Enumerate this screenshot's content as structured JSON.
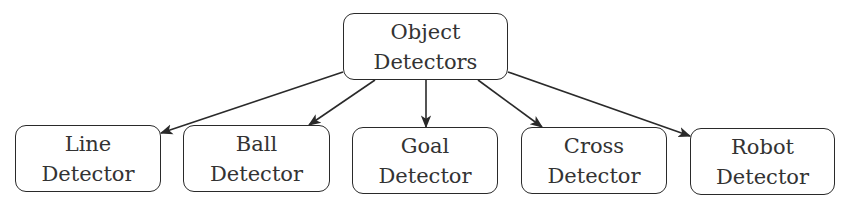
{
  "diagram": {
    "root": {
      "id": "object-detectors",
      "lines": [
        "Object",
        "Detectors"
      ],
      "box": [
        343,
        13,
        165,
        67
      ]
    },
    "children": [
      {
        "id": "line-detector",
        "lines": [
          "Line",
          "Detector"
        ],
        "box": [
          15,
          125,
          146,
          67
        ]
      },
      {
        "id": "ball-detector",
        "lines": [
          "Ball",
          "Detector"
        ],
        "box": [
          183,
          125,
          147,
          67
        ]
      },
      {
        "id": "goal-detector",
        "lines": [
          "Goal",
          "Detector"
        ],
        "box": [
          352,
          127,
          146,
          67
        ]
      },
      {
        "id": "cross-detector",
        "lines": [
          "Cross",
          "Detector"
        ],
        "box": [
          521,
          127,
          146,
          67
        ]
      },
      {
        "id": "robot-detector",
        "lines": [
          "Robot",
          "Detector"
        ],
        "box": [
          690,
          128,
          145,
          67
        ]
      }
    ],
    "edges": [
      {
        "from": "object-detectors",
        "to": "line-detector",
        "x1": 343,
        "y1": 72,
        "x2": 161,
        "y2": 133
      },
      {
        "from": "object-detectors",
        "to": "ball-detector",
        "x1": 375,
        "y1": 80,
        "x2": 309,
        "y2": 125
      },
      {
        "from": "object-detectors",
        "to": "goal-detector",
        "x1": 426,
        "y1": 80,
        "x2": 426,
        "y2": 127
      },
      {
        "from": "object-detectors",
        "to": "cross-detector",
        "x1": 478,
        "y1": 80,
        "x2": 542,
        "y2": 127
      },
      {
        "from": "object-detectors",
        "to": "robot-detector",
        "x1": 508,
        "y1": 72,
        "x2": 690,
        "y2": 136
      }
    ],
    "colors": {
      "stroke": "#2a2a2a",
      "text": "#333333",
      "background": "#ffffff"
    }
  }
}
